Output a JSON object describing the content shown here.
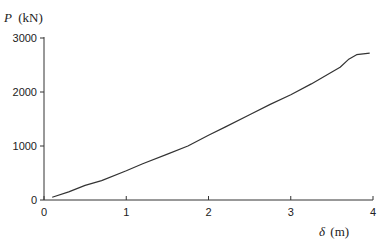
{
  "chart_data": {
    "type": "line",
    "title": "",
    "xlabel": "δ (m)",
    "ylabel": "P (kN)",
    "xlabel_symbol": "δ",
    "xlabel_unit": "(m)",
    "ylabel_symbol": "P",
    "ylabel_unit": "(kN)",
    "xlim": [
      0,
      4
    ],
    "ylim": [
      0,
      3000
    ],
    "x_ticks": [
      0,
      1,
      2,
      3,
      4
    ],
    "y_ticks": [
      0,
      1000,
      2000,
      3000
    ],
    "grid": false,
    "legend": null,
    "series": [
      {
        "name": "P-δ curve",
        "color": "#333333",
        "x": [
          0.1,
          0.3,
          0.5,
          0.7,
          1.0,
          1.2,
          1.5,
          1.75,
          2.0,
          2.2,
          2.5,
          2.75,
          3.0,
          3.25,
          3.5,
          3.6,
          3.7,
          3.8,
          3.96
        ],
        "y": [
          50,
          150,
          270,
          360,
          540,
          670,
          850,
          1000,
          1200,
          1350,
          1580,
          1770,
          1950,
          2150,
          2370,
          2460,
          2600,
          2690,
          2720
        ]
      }
    ]
  }
}
